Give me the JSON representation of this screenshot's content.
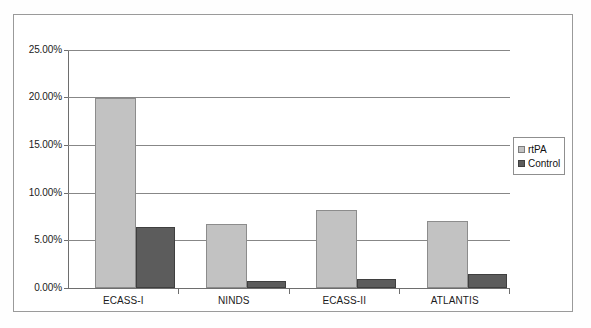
{
  "chart_data": {
    "type": "bar",
    "title": "",
    "subtitle": "",
    "xlabel": "",
    "ylabel": "",
    "categories": [
      "ECASS-I",
      "NINDS",
      "ECASS-II",
      "ATLANTIS"
    ],
    "series": [
      {
        "name": "rtPA",
        "color": "#c2c2c2",
        "values": [
          20.0,
          6.7,
          8.2,
          7.0
        ]
      },
      {
        "name": "Control",
        "color": "#5c5c5c",
        "values": [
          6.4,
          0.7,
          0.9,
          1.5
        ]
      }
    ],
    "ylim": [
      0,
      25
    ],
    "ytick_values": [
      0,
      5,
      10,
      15,
      20,
      25
    ],
    "ytick_labels": [
      "0.00%",
      "5.00%",
      "10.00%",
      "15.00%",
      "20.00%",
      "25.00%"
    ],
    "grid": true,
    "grid_axis": "y",
    "legend_position": "right",
    "value_format": "percent"
  },
  "legend": {
    "items": [
      {
        "label": "rtPA",
        "swatch": "legend-swatch-rtpa"
      },
      {
        "label": "Control",
        "swatch": "legend-swatch-control"
      }
    ]
  },
  "axes": {
    "y_labels": [
      "25.00%",
      "20.00%",
      "15.00%",
      "10.00%",
      "5.00%",
      "0.00%"
    ],
    "x_labels": [
      "ECASS-I",
      "NINDS",
      "ECASS-II",
      "ATLANTIS"
    ]
  }
}
